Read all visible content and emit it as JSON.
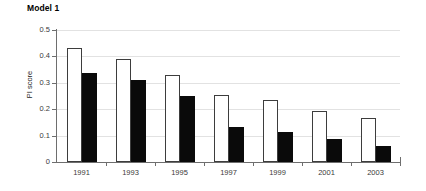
{
  "chart_data": {
    "type": "bar",
    "title": "Model 1",
    "xlabel": "",
    "ylabel": "PI score",
    "categories": [
      "1991",
      "1993",
      "1995",
      "1997",
      "1999",
      "2001",
      "2003"
    ],
    "series": [
      {
        "name": "white-bar",
        "style": "open",
        "color": "#ffffff",
        "values": [
          0.43,
          0.39,
          0.33,
          0.255,
          0.235,
          0.195,
          0.165
        ]
      },
      {
        "name": "black-bar",
        "style": "filled",
        "color": "#0a0a0a",
        "values": [
          0.337,
          0.311,
          0.251,
          0.134,
          0.115,
          0.089,
          0.06
        ]
      }
    ],
    "ylim": [
      0,
      0.5
    ],
    "yticks": [
      "0",
      "0.1",
      "0.2",
      "0.3",
      "0.4",
      "0.5"
    ],
    "ytick_values": [
      0,
      0.1,
      0.2,
      0.3,
      0.4,
      0.5
    ],
    "grid": true,
    "grid_axis": "y",
    "grid_color": "#e2e2e2",
    "legend": "none",
    "axis_color": "#6e6e6e"
  }
}
